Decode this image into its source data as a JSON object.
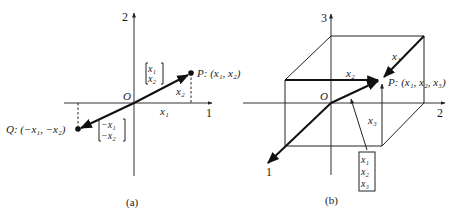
{
  "figure": {
    "panel_a": {
      "caption": "(a)",
      "axis_x_label": "1",
      "axis_y_label": "2",
      "origin_label": "O",
      "point_p": {
        "name": "P",
        "coords": "(x₁, x₂)",
        "label": "P:  (x₁, x₂)"
      },
      "point_q": {
        "name": "Q",
        "coords": "(−x₁, −x₂)",
        "label": "Q:  (−x₁, −x₂)"
      },
      "vector_p": [
        "x₁",
        "x₂"
      ],
      "vector_q": [
        "−x₁",
        "−x₂"
      ],
      "component_x_label": "x₁",
      "component_y_label": "x₂"
    },
    "panel_b": {
      "caption": "(b)",
      "axis_1_label": "1",
      "axis_2_label": "2",
      "axis_3_label": "3",
      "origin_label": "O",
      "point_p": {
        "name": "P",
        "coords": "(x₁, x₂, x₃)",
        "label": "P:  (x₁, x₂, x₃)"
      },
      "vector_p": [
        "x₁",
        "x₂",
        "x₃"
      ],
      "component_1_label": "x₁",
      "component_2_label": "x₂",
      "component_3_label": "x₃"
    },
    "colors": {
      "ink": "#111111",
      "background": "#ffffff"
    }
  }
}
